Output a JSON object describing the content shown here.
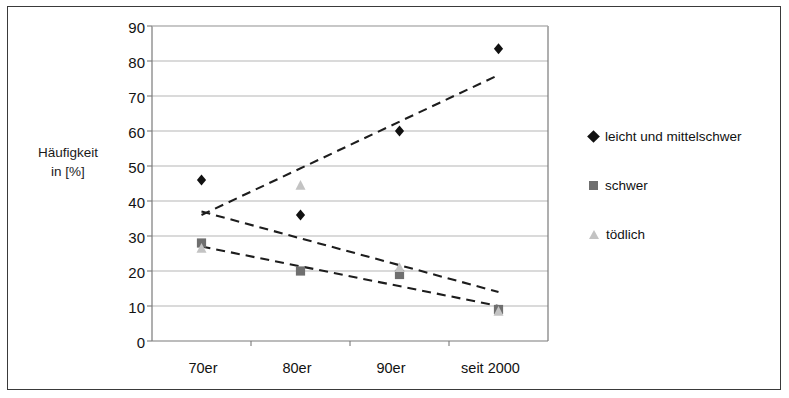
{
  "chart_data": {
    "type": "scatter",
    "title": "",
    "xlabel": "",
    "ylabel": "Häufigkeit in [%]",
    "ylabel_lines": [
      "Häufigkeit",
      "in [%]"
    ],
    "categories": [
      "70er",
      "80er",
      "90er",
      "seit 2000"
    ],
    "ylim": [
      0,
      90
    ],
    "yticks": [
      0,
      10,
      20,
      30,
      40,
      50,
      60,
      70,
      80,
      90
    ],
    "grid": true,
    "legend_position": "right",
    "series": [
      {
        "name": "leicht und mittelschwer",
        "marker": "diamond",
        "color": "#111111",
        "values": [
          46,
          36,
          60,
          83.5
        ],
        "trendline": {
          "start": 36,
          "end": 76
        }
      },
      {
        "name": "schwer",
        "marker": "square",
        "color": "#6f6f6f",
        "values": [
          28,
          20,
          19,
          9
        ],
        "trendline": {
          "start": 27,
          "end": 10
        }
      },
      {
        "name": "tödlich",
        "marker": "triangle",
        "color": "#c3c3c3",
        "values": [
          26.5,
          44.5,
          21,
          8.5
        ],
        "trendline": {
          "start": 37,
          "end": 14
        }
      }
    ]
  },
  "axis": {
    "y_title_line1": "Häufigkeit",
    "y_title_line2": "in [%]",
    "y_tick_90": "90",
    "y_tick_80": "80",
    "y_tick_70": "70",
    "y_tick_60": "60",
    "y_tick_50": "50",
    "y_tick_40": "40",
    "y_tick_30": "30",
    "y_tick_20": "20",
    "y_tick_10": "10",
    "y_tick_0": "0",
    "x_tick_0": "70er",
    "x_tick_1": "80er",
    "x_tick_2": "90er",
    "x_tick_3": "seit 2000"
  },
  "legend": {
    "item0": "leicht und mittelschwer",
    "item1": "schwer",
    "item2": "tödlich"
  }
}
